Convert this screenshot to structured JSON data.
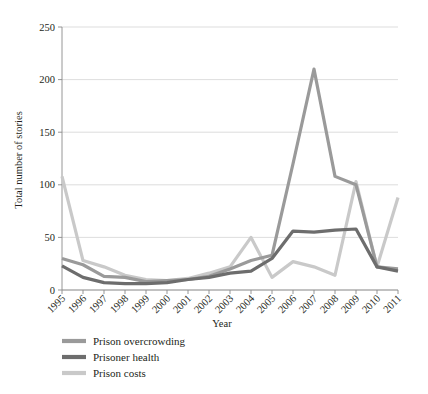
{
  "chart_data": {
    "type": "line",
    "title": "",
    "xlabel": "Year",
    "ylabel": "Total number of stories",
    "categories": [
      "1995",
      "1996",
      "1997",
      "1998",
      "1999",
      "2000",
      "2001",
      "2002",
      "2003",
      "2004",
      "2005",
      "2006",
      "2007",
      "2008",
      "2009",
      "2010",
      "2011"
    ],
    "ylim": [
      0,
      250
    ],
    "yticks": [
      0,
      50,
      100,
      150,
      200,
      250
    ],
    "ytick_labels": [
      "0",
      "50",
      "100",
      "150",
      "200",
      "250"
    ],
    "grid": "horizontal",
    "legend_position": "below-left",
    "series": [
      {
        "name": "Prison overcrowding",
        "color": "#9a9a9a",
        "values": [
          30,
          24,
          13,
          12,
          8,
          9,
          10,
          13,
          20,
          28,
          33,
          120,
          210,
          108,
          100,
          22,
          20
        ]
      },
      {
        "name": "Prisoner health",
        "color": "#6d6d6d",
        "values": [
          23,
          12,
          7,
          6,
          6,
          7,
          10,
          12,
          16,
          18,
          30,
          56,
          55,
          57,
          58,
          22,
          18
        ]
      },
      {
        "name": "Prison costs",
        "color": "#c9c9c9",
        "values": [
          108,
          28,
          22,
          14,
          10,
          9,
          11,
          16,
          22,
          50,
          12,
          27,
          22,
          14,
          103,
          22,
          88
        ]
      }
    ]
  },
  "axes": {
    "x_title": "Year",
    "y_title": "Total number of stories"
  },
  "legend": {
    "items": [
      {
        "label": "Prison overcrowding",
        "color": "#9a9a9a"
      },
      {
        "label": "Prisoner health",
        "color": "#6d6d6d"
      },
      {
        "label": "Prison costs",
        "color": "#c9c9c9"
      }
    ]
  }
}
